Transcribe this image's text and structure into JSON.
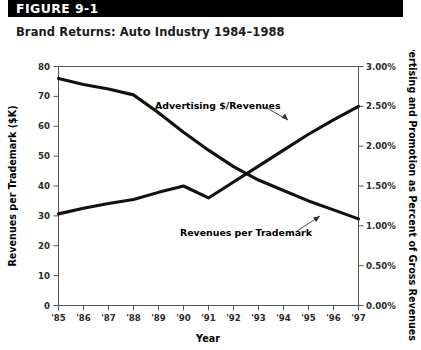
{
  "figure": {
    "header_label": "FIGURE 9-1",
    "subtitle": "Brand Returns: Auto Industry 1984–1988"
  },
  "colors": {
    "header_band": "#000000",
    "header_text": "#ffffff",
    "line": "#111111",
    "axis": "#555555",
    "text": "#000000",
    "background": "#ffffff"
  },
  "chart_data": {
    "type": "line",
    "title": "Brand Returns: Auto Industry 1984–1988",
    "subtitle": "",
    "xlabel": "Year",
    "ylabel": "Revenues per Trademark ($K)",
    "y2label": "Advertising and Promotion as Percent of Gross Revenues",
    "grid": false,
    "legend_position": "inline-annotations",
    "x": [
      "'85",
      "'86",
      "'87",
      "'88",
      "'89",
      "'90",
      "'91",
      "'92",
      "'93",
      "'94",
      "'95",
      "'96",
      "'97"
    ],
    "xlim": [
      "'85",
      "'97"
    ],
    "ylim": [
      0,
      80
    ],
    "yticks": [
      0,
      10,
      20,
      30,
      40,
      50,
      60,
      70,
      80
    ],
    "ytick_labels": [
      "0",
      "10",
      "20",
      "30",
      "40",
      "50",
      "60",
      "70",
      "80"
    ],
    "y2lim": [
      0,
      3
    ],
    "y2ticks": [
      0,
      0.5,
      1.0,
      1.5,
      2.0,
      2.5,
      3.0
    ],
    "y2tick_labels": [
      "0.00%",
      "0.50%",
      "1.00%",
      "1.50%",
      "2.00%",
      "2.50%",
      "3.00%"
    ],
    "series": [
      {
        "name": "Revenues per Trademark",
        "axis": "left",
        "units": "$K",
        "annotation": "Revenues per Trademark",
        "values": [
          76.0,
          74.0,
          72.5,
          70.5,
          64.5,
          58.0,
          52.0,
          46.5,
          42.0,
          38.5,
          35.0,
          32.0,
          29.0
        ]
      },
      {
        "name": "Advertising $/Revenues",
        "axis": "right",
        "units": "%",
        "annotation": "Advertising $/Revenues",
        "values": [
          1.15,
          1.22,
          1.28,
          1.33,
          1.42,
          1.5,
          1.35,
          1.55,
          1.75,
          1.95,
          2.15,
          2.33,
          2.5
        ]
      }
    ]
  }
}
